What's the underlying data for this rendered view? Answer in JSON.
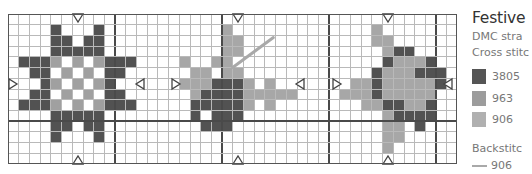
{
  "legend": {
    "title": "Festive",
    "line1": "DMC stra",
    "line2": "Cross stitc",
    "items": [
      {
        "code": "3805",
        "color": "#555555",
        "symbol": "D"
      },
      {
        "code": "963",
        "color": "#9c9c9c",
        "symbol": "M"
      },
      {
        "code": "906",
        "color": "#b0b0b0",
        "symbol": "L"
      }
    ],
    "backstitch_label": "Backstitc",
    "backstitch_item": {
      "code": "906",
      "color": "#a9a9a9"
    }
  },
  "chart_data": {
    "type": "heatmap",
    "title": "Festive",
    "cols": 42,
    "rows": 14,
    "cell_px": 10.7,
    "major_every": 10,
    "colors": {
      "D": "#525252",
      "M": "#a0a0a0",
      "L": "#a7a7a7",
      ".": null
    },
    "legend": {
      "D": "3805",
      "M": "963",
      "L": "906"
    },
    "pattern": [
      "..........................................",
      "....D...D...........L.............L.......",
      "....DD.DD...........LL............LL......",
      "....DDDDD...........LL.............LDD....",
      ".DDDM.M.MDDD....L..LL..............DLLLD..",
      "..DD.M.M.DD......LL.LL............DLLLDDD.",
      "...DM.M.MD......LLLDDDL.L.......LLDLLLLLD.",
      "..DD.M.M.DD......LDDDDLLLLL....LLLDLLLLL..",
      ".DDDM.M.MDDD.....DDDDDL.L........LLDDLLD..",
      "....DDDDD........D.DDD.............LDDDD..",
      "....DD.DD.........DDD..............LL.D...",
      "....D...D..........................LL.....",
      "...................................L......",
      ".........................................."
    ],
    "backstitch": [
      {
        "from": [
          21,
          5
        ],
        "to": [
          24.8,
          2.2
        ],
        "code": "906"
      }
    ],
    "center_markers": {
      "top": [
        6.5,
        21.5,
        35.5
      ],
      "bottom": [
        6.5,
        21.5,
        35.5
      ],
      "left": [
        {
          "col": 0,
          "row": 6.5
        },
        {
          "col": 15.2,
          "row": 6.5
        },
        {
          "col": 30.3,
          "row": 6.5
        }
      ],
      "right": [
        {
          "col": 12.8,
          "row": 6.5
        },
        {
          "col": 27.8,
          "row": 6.5
        },
        {
          "col": 41.6,
          "row": 6.5
        }
      ]
    }
  }
}
